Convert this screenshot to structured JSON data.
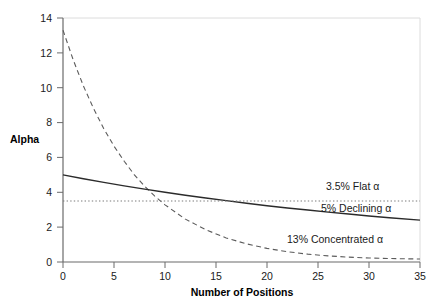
{
  "chart_data": {
    "type": "line",
    "title": "",
    "xlabel": "Number of Positions",
    "ylabel": "Alpha",
    "xlim": [
      0,
      35
    ],
    "ylim": [
      0,
      14
    ],
    "xticks": [
      "0",
      "5",
      "10",
      "15",
      "20",
      "25",
      "30",
      "35"
    ],
    "xtick_values": [
      0,
      5,
      10,
      15,
      20,
      25,
      30,
      35
    ],
    "yticks": [
      "0",
      "2",
      "4",
      "6",
      "8",
      "10",
      "12",
      "14"
    ],
    "ytick_values": [
      0,
      2,
      4,
      6,
      8,
      10,
      12,
      14
    ],
    "grid": false,
    "legend_position": "inline-annotations",
    "series": [
      {
        "name": "3.5% Flat α",
        "style": "dotted",
        "color": "#7a7a7a",
        "x": [
          0,
          35
        ],
        "values": [
          3.5,
          3.5
        ]
      },
      {
        "name": "5% Declining α",
        "style": "solid",
        "color": "#2b2b2b",
        "x": [
          0,
          2,
          4,
          6,
          8,
          10,
          12,
          14,
          16,
          18,
          20,
          22,
          24,
          26,
          28,
          30,
          32,
          35
        ],
        "values": [
          5.0,
          4.78,
          4.57,
          4.37,
          4.18,
          4.0,
          3.83,
          3.67,
          3.52,
          3.37,
          3.23,
          3.1,
          2.98,
          2.86,
          2.75,
          2.64,
          2.54,
          2.4
        ]
      },
      {
        "name": "13% Concentrated α",
        "style": "dashed",
        "color": "#5c5c5c",
        "x": [
          0,
          1,
          2,
          3,
          4,
          5,
          6,
          7,
          8,
          9,
          10,
          12,
          14,
          16,
          18,
          20,
          22,
          24,
          26,
          28,
          30,
          32,
          35
        ],
        "values": [
          13.3,
          11.6,
          10.1,
          8.8,
          7.65,
          6.65,
          5.78,
          5.0,
          4.35,
          3.78,
          3.28,
          2.46,
          1.85,
          1.38,
          1.04,
          0.78,
          0.59,
          0.45,
          0.35,
          0.28,
          0.23,
          0.2,
          0.17
        ]
      }
    ],
    "annotations": [
      {
        "text": "3.5% Flat α",
        "x": 24.2,
        "y": 4.3
      },
      {
        "text": "5% Declining α",
        "x": 23.5,
        "y": 3.05
      },
      {
        "text": "13% Concentrated α",
        "x": 21.0,
        "y": 1.35
      }
    ]
  },
  "axes": {
    "ylabel": "Alpha",
    "xlabel": "Number of Positions"
  },
  "colors": {
    "axis": "#6b6b6b",
    "plot_border": "#d8d8d8",
    "text": "#1a1a1a",
    "flat_line": "#7a7a7a",
    "declining_line": "#2b2b2b",
    "concentrated_line": "#5c5c5c"
  }
}
